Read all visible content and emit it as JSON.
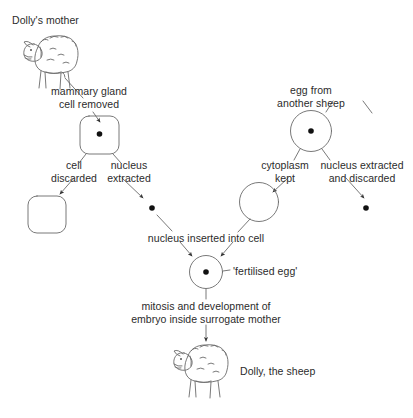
{
  "diagram": {
    "type": "flow-diagram",
    "background_color": "#ffffff",
    "stroke_color": "#555555",
    "text_color": "#2b2b2b",
    "labels": {
      "dollys_mother": "Dolly's mother",
      "mammary_gland_cell_removed": "mammary gland\ncell removed",
      "cell_discarded": "cell\ndiscarded",
      "nucleus_extracted": "nucleus\nextracted",
      "egg_from_another_sheep": "egg from\nanother sheep",
      "cytoplasm_kept": "cytoplasm\nkept",
      "nucleus_extracted_and_discarded": "nucleus extracted\nand discarded",
      "nucleus_inserted_into_cell": "nucleus inserted into cell",
      "fertilised_egg": "'fertilised egg'",
      "mitosis_and_development": "mitosis and development of\nembryo inside surrogate mother",
      "dolly_the_sheep": "Dolly, the sheep"
    },
    "nodes": [
      {
        "id": "mother-sheep",
        "kind": "sheep-illustration",
        "label": "Dolly's mother"
      },
      {
        "id": "mammary-cell",
        "kind": "rounded-square-cell",
        "has_nucleus": true,
        "label": "mammary gland cell removed"
      },
      {
        "id": "discarded-cell",
        "kind": "rounded-square-cell",
        "has_nucleus": false,
        "label": "cell discarded"
      },
      {
        "id": "extracted-nucleus",
        "kind": "nucleus-dot",
        "label": "nucleus extracted"
      },
      {
        "id": "donor-egg",
        "kind": "circle-cell",
        "has_nucleus": true,
        "label": "egg from another sheep"
      },
      {
        "id": "cytoplasm",
        "kind": "circle-cell",
        "has_nucleus": false,
        "label": "cytoplasm kept"
      },
      {
        "id": "discarded-nucleus",
        "kind": "nucleus-dot",
        "label": "nucleus extracted and discarded"
      },
      {
        "id": "fertilised-egg",
        "kind": "circle-cell",
        "has_nucleus": true,
        "label": "'fertilised egg'"
      },
      {
        "id": "dolly-sheep",
        "kind": "sheep-illustration",
        "label": "Dolly, the sheep"
      }
    ],
    "edges": [
      {
        "from": "mother-sheep",
        "to": "mammary-cell",
        "label": "mammary gland cell removed"
      },
      {
        "from": "mammary-cell",
        "to": "discarded-cell",
        "label": "cell discarded"
      },
      {
        "from": "mammary-cell",
        "to": "extracted-nucleus",
        "label": "nucleus extracted"
      },
      {
        "from": "donor-egg",
        "to": "cytoplasm",
        "label": "cytoplasm kept"
      },
      {
        "from": "donor-egg",
        "to": "discarded-nucleus",
        "label": "nucleus extracted and discarded"
      },
      {
        "from": "extracted-nucleus",
        "to": "fertilised-egg",
        "label": "nucleus inserted into cell"
      },
      {
        "from": "cytoplasm",
        "to": "fertilised-egg",
        "label": "nucleus inserted into cell"
      },
      {
        "from": "fertilised-egg",
        "to": "dolly-sheep",
        "label": "mitosis and development of embryo inside surrogate mother"
      }
    ]
  }
}
